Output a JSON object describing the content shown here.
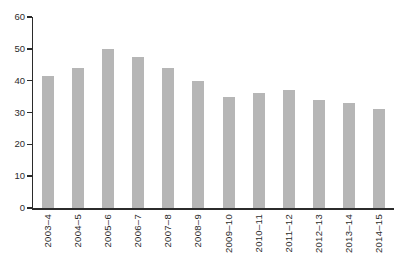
{
  "figure": {
    "background": "#ffffff"
  },
  "chart_data": {
    "type": "bar",
    "title": "",
    "xlabel": "",
    "ylabel": "",
    "categories": [
      "2003–4",
      "2004–5",
      "2005–6",
      "2006–7",
      "2007–8",
      "2008–9",
      "2009–10",
      "2010–11",
      "2011–12",
      "2012–13",
      "2013–14",
      "2014–15"
    ],
    "values": [
      41.5,
      44,
      50,
      47.5,
      44,
      40,
      35,
      36,
      37,
      34,
      33,
      31
    ],
    "ylim": [
      0,
      60
    ],
    "yticks": [
      0,
      10,
      20,
      30,
      40,
      50,
      60
    ],
    "grid": false,
    "legend": "none",
    "bar_color": "#b6b6b6",
    "axis_color": "#2b2b2b",
    "text_color": "#2b2b2b"
  }
}
